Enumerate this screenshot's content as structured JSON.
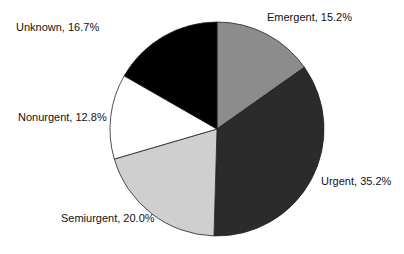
{
  "chart_data": {
    "type": "pie",
    "title": "",
    "start_angle_deg": 0,
    "direction": "clockwise",
    "slices": [
      {
        "label": "Emergent",
        "value": 15.2,
        "display": "Emergent, 15.2%",
        "color": "#8c8c8c"
      },
      {
        "label": "Urgent",
        "value": 35.2,
        "display": "Urgent, 35.2%",
        "color": "#2b2b2b"
      },
      {
        "label": "Semiurgent",
        "value": 20.0,
        "display": "Semiurgent, 20.0%",
        "color": "#cfcfcf"
      },
      {
        "label": "Nonurgent",
        "value": 12.8,
        "display": "Nonurgent, 12.8%",
        "color": "#ffffff"
      },
      {
        "label": "Unknown",
        "value": 16.7,
        "display": "Unknown, 16.7%",
        "color": "#000000"
      }
    ]
  },
  "labels": {
    "emergent": "Emergent, 15.2%",
    "urgent": "Urgent, 35.2%",
    "semiurgent": "Semiurgent, 20.0%",
    "nonurgent": "Nonurgent, 12.8%",
    "unknown": "Unknown, 16.7%"
  }
}
